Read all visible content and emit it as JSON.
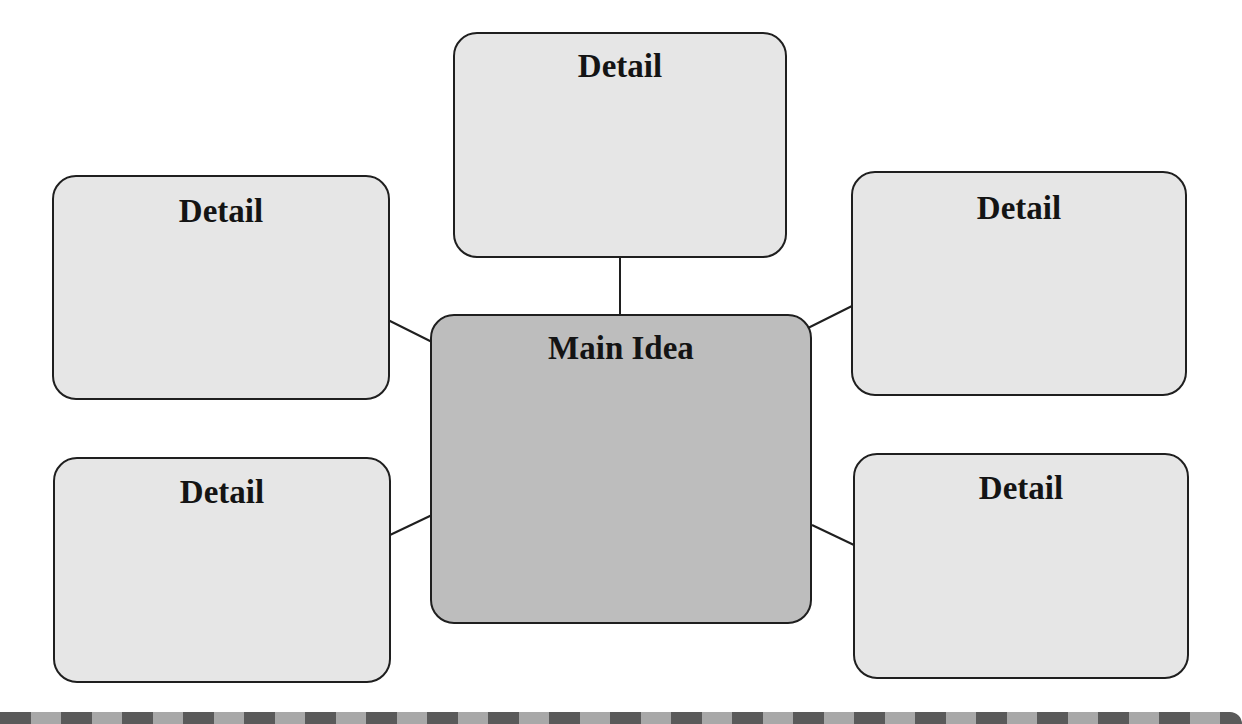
{
  "diagram": {
    "type": "main-idea-and-details web",
    "main_idea": {
      "label": "Main Idea",
      "fill": "#bdbdbd"
    },
    "details": [
      {
        "id": "top",
        "label": "Detail"
      },
      {
        "id": "upper-left",
        "label": "Detail"
      },
      {
        "id": "upper-right",
        "label": "Detail"
      },
      {
        "id": "lower-left",
        "label": "Detail"
      },
      {
        "id": "lower-right",
        "label": "Detail"
      }
    ],
    "detail_fill": "#e6e6e6",
    "border_color": "#1f1f1f",
    "footer_stripe": {
      "dark": "#5a5a5a",
      "light": "#a8a8a8"
    }
  }
}
